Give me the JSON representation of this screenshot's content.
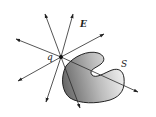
{
  "diagram": {
    "charge_label": "q",
    "field_label": "E",
    "surface_label": "S",
    "colors": {
      "line": "#2a2a2a",
      "surface_dark": "#6e6e6e",
      "surface_light": "#f2f2f2",
      "charge": "#111111"
    }
  }
}
